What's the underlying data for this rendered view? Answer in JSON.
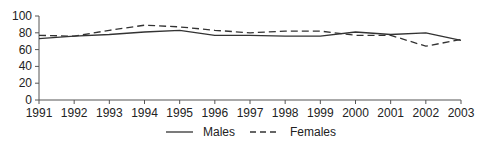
{
  "chart_data": {
    "type": "line",
    "title": "",
    "xlabel": "",
    "ylabel": "",
    "x": [
      "1991",
      "1992",
      "1993",
      "1994",
      "1995",
      "1996",
      "1997",
      "1998",
      "1999",
      "2000",
      "2001",
      "2002",
      "2003"
    ],
    "series": [
      {
        "name": "Males",
        "style": "solid",
        "color": "#333333",
        "values": [
          73,
          76,
          78,
          81,
          83,
          77,
          77,
          76,
          76,
          81,
          78,
          80,
          71
        ]
      },
      {
        "name": "Females",
        "style": "dashed",
        "color": "#333333",
        "values": [
          77,
          76,
          83,
          89,
          87,
          83,
          80,
          82,
          82,
          77,
          77,
          64,
          72
        ]
      }
    ],
    "ylim": [
      0,
      100
    ],
    "yticks": [
      0,
      20,
      40,
      60,
      80,
      100
    ],
    "grid": false,
    "legend_position": "bottom-center"
  },
  "legend": {
    "males_label": "Males",
    "females_label": "Females"
  }
}
